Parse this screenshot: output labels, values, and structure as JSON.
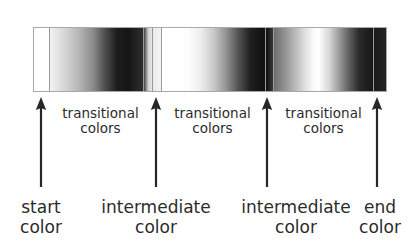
{
  "figure": {
    "kind": "gradient-anchor-diagram",
    "background_color": "#ffffff",
    "text_color": "#2b2b2b",
    "strip_border_color": "#a8a8a8"
  },
  "gradient_strip": {
    "name": "grayscale-gradient-strip",
    "segments": [
      {
        "label": "start-color-block",
        "start_color": "#ffffff",
        "end_color": "#ffffff"
      },
      {
        "label": "transition-1",
        "start_color": "#f2f2f2",
        "end_color": "#2e2e2e"
      },
      {
        "label": "intermediate-1-approach",
        "start_color": "#3d3d3d",
        "end_color": "#e8e8e8"
      },
      {
        "label": "intermediate-1-block",
        "start_color": "#eaeaea",
        "end_color": "#f4f4f4"
      },
      {
        "label": "transition-2",
        "start_color": "#ffffff",
        "end_color": "#101010"
      },
      {
        "label": "intermediate-2-block",
        "start_color": "#0d0d0d",
        "end_color": "#3a3a3a"
      },
      {
        "label": "transition-3",
        "start_color": "#6e6e6e",
        "end_color": "#161616"
      },
      {
        "label": "end-color-block",
        "start_color": "#1b1b1b",
        "end_color": "#242424"
      }
    ]
  },
  "arrows": [
    {
      "name": "anchor-arrow-start",
      "points_to": "start color"
    },
    {
      "name": "anchor-arrow-intermediate-1",
      "points_to": "intermediate color"
    },
    {
      "name": "anchor-arrow-intermediate-2",
      "points_to": "intermediate color"
    },
    {
      "name": "anchor-arrow-end",
      "points_to": "end color"
    }
  ],
  "transitional_labels": [
    {
      "text": "transitional\ncolors"
    },
    {
      "text": "transitional\ncolors"
    },
    {
      "text": "transitional\ncolors"
    }
  ],
  "anchor_labels": [
    {
      "text": "start\ncolor"
    },
    {
      "text": "intermediate\ncolor"
    },
    {
      "text": "intermediate\ncolor"
    },
    {
      "text": "end\ncolor"
    }
  ]
}
